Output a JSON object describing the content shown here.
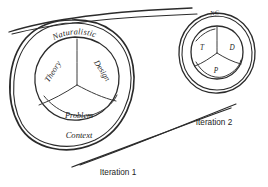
{
  "diagram": {
    "kind": "hand-drawn-sketch",
    "medium": "pen on white paper",
    "background_color": "#ffffff",
    "ink_color": "#2b2b2b",
    "iteration_1": {
      "label": "Iteration 1",
      "outer_ring": {
        "top_label": "Naturalistic",
        "bottom_label": "Context"
      },
      "inner_wedges": [
        {
          "id": "theory",
          "label": "Theory"
        },
        {
          "id": "design",
          "label": "Design"
        },
        {
          "id": "problem",
          "label": "Problem"
        }
      ]
    },
    "iteration_2": {
      "label": "Iteration 2",
      "outer_ring": {
        "top_label": "NC"
      },
      "inner_wedges": [
        {
          "id": "theory",
          "label": "T"
        },
        {
          "id": "design",
          "label": "D"
        },
        {
          "id": "problem",
          "label": "P"
        }
      ]
    },
    "connectors": [
      {
        "id": "top-connector",
        "from": "iteration-1",
        "to": "iteration-2"
      },
      {
        "id": "bottom-connector",
        "from": "iteration-1",
        "to": "iteration-2"
      }
    ]
  }
}
